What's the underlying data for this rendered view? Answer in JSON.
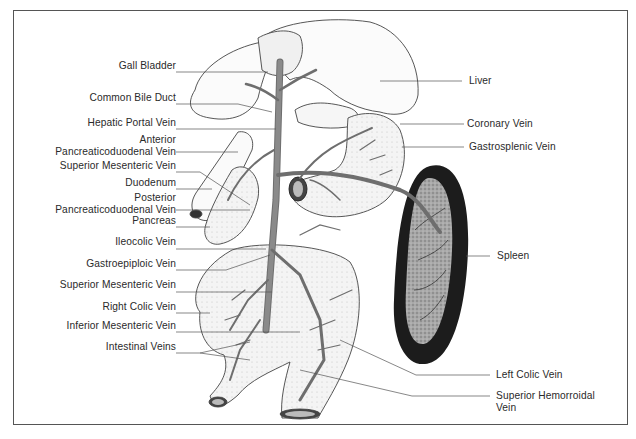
{
  "diagram": {
    "left_labels": [
      {
        "id": "gall-bladder",
        "lines": [
          "Gall Bladder"
        ],
        "y": 66
      },
      {
        "id": "common-bile-duct",
        "lines": [
          "Common Bile Duct"
        ],
        "y": 98
      },
      {
        "id": "hepatic-portal-vein",
        "lines": [
          "Hepatic Portal Vein"
        ],
        "y": 123
      },
      {
        "id": "anterior-pancreaticoduodenal-vein",
        "lines": [
          "Anterior",
          "Pancreaticoduodenal Vein"
        ],
        "y": 140
      },
      {
        "id": "superior-mesenteric-vein-upper",
        "lines": [
          "Superior Mesenteric Vein"
        ],
        "y": 166
      },
      {
        "id": "duodenum",
        "lines": [
          "Duodenum"
        ],
        "y": 183
      },
      {
        "id": "posterior-pancreaticoduodenal-vein",
        "lines": [
          "Posterior",
          "Pancreaticoduodenal Vein"
        ],
        "y": 198
      },
      {
        "id": "pancreas",
        "lines": [
          "Pancreas"
        ],
        "y": 221
      },
      {
        "id": "ileocolic-vein",
        "lines": [
          "Ileocolic Vein"
        ],
        "y": 242
      },
      {
        "id": "gastroepiploic-vein",
        "lines": [
          "Gastroepiploic Vein"
        ],
        "y": 264
      },
      {
        "id": "superior-mesenteric-vein-lower",
        "lines": [
          "Superior Mesenteric Vein"
        ],
        "y": 285
      },
      {
        "id": "right-colic-vein",
        "lines": [
          "Right Colic Vein"
        ],
        "y": 307
      },
      {
        "id": "inferior-mesenteric-vein",
        "lines": [
          "Inferior Mesenteric Vein"
        ],
        "y": 326
      },
      {
        "id": "intestinal-veins",
        "lines": [
          "Intestinal Veins"
        ],
        "y": 347
      }
    ],
    "right_labels": [
      {
        "id": "liver",
        "lines": [
          "Liver"
        ],
        "x": 469,
        "y": 75
      },
      {
        "id": "coronary-vein",
        "lines": [
          "Coronary Vein"
        ],
        "x": 467,
        "y": 118
      },
      {
        "id": "gastrosplenic-vein",
        "lines": [
          "Gastrosplenic Vein"
        ],
        "x": 469,
        "y": 141
      },
      {
        "id": "spleen",
        "lines": [
          "Spleen"
        ],
        "x": 497,
        "y": 250
      },
      {
        "id": "left-colic-vein",
        "lines": [
          "Left Colic Vein"
        ],
        "x": 496,
        "y": 370
      },
      {
        "id": "superior-hemorroidal-vein",
        "lines": [
          "Superior Hemorroidal",
          "Vein"
        ],
        "x": 496,
        "y": 390
      }
    ],
    "colors": {
      "ink": "#2a2a2a",
      "vein": "#7a7a7a",
      "spleen_rim": "#1c1c1c",
      "spleen_fill": "#9a9a9a",
      "organ_fill": "#f3f3f3",
      "frame": "#555555"
    }
  }
}
